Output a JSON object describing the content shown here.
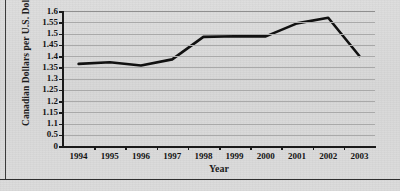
{
  "chart_data": {
    "type": "line",
    "title": "",
    "xlabel": "Year",
    "ylabel": "Canadian Dollars per U.S. Dollar",
    "categories": [
      "1994",
      "1995",
      "1996",
      "1997",
      "1998",
      "1999",
      "2000",
      "2001",
      "2002",
      "2003"
    ],
    "x": [
      1994,
      1995,
      1996,
      1997,
      1998,
      1999,
      2000,
      2001,
      2002,
      2003
    ],
    "series": [
      {
        "name": "Canadian Dollars per U.S. Dollar",
        "values": [
          1.365,
          1.372,
          1.358,
          1.385,
          1.485,
          1.488,
          1.487,
          1.545,
          1.57,
          1.4
        ],
        "color": "#111111"
      }
    ],
    "ytick_labels": [
      "1.6",
      "1.55",
      "1.5",
      "1.45",
      "1.4",
      "1.35",
      "1.3",
      "1.25",
      "1.2",
      "1.15",
      "1.1",
      "0.5",
      "0"
    ],
    "ytick_values": [
      1.6,
      1.55,
      1.5,
      1.45,
      1.4,
      1.35,
      1.3,
      1.25,
      1.2,
      1.15,
      1.1,
      0.5,
      0
    ],
    "xtick_labels": [
      "1994",
      "1995",
      "1996",
      "1997",
      "1998",
      "1999",
      "2000",
      "2001",
      "2002",
      "2003"
    ],
    "ylim": [
      0,
      1.6
    ],
    "xlim": [
      1993.5,
      2003.5
    ],
    "grid": true,
    "legend": false,
    "legend_position": "none",
    "line_color": "#111111",
    "grid_color": "#a9a9a9",
    "background_color": "#d9d9d9",
    "axis_color": "#1a1a1a"
  }
}
